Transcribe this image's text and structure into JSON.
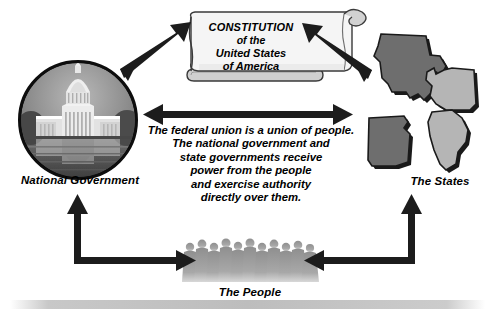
{
  "diagram": {
    "background_color": "#ffffff"
  },
  "scroll": {
    "name": "constitution-scroll",
    "line1": "CONSTITUTION",
    "line2": "of the",
    "line3": "United States",
    "line4": "of America",
    "paper_color": "#f4f4f4",
    "roll_color": "#c9c9c9",
    "outline_color": "#3a3a3a"
  },
  "national_government": {
    "label": "National Government",
    "image_alt": "united-states-capitol-photo",
    "circle_border_color": "#111111",
    "sky_color": "#8d8d8d",
    "building_color": "#e8e8e8"
  },
  "states": {
    "label": "The States",
    "shapes": [
      {
        "name": "texas",
        "fill": "#6e6e6e"
      },
      {
        "name": "washington",
        "fill": "#b5b5b5"
      },
      {
        "name": "arkansas",
        "fill": "#6e6e6e"
      },
      {
        "name": "maine",
        "fill": "#b5b5b5"
      }
    ],
    "shadow_color": "#1a1a1a"
  },
  "people": {
    "label": "The People",
    "silhouette_color": "#9a9a9a",
    "count": 11
  },
  "center_statement": {
    "line1": "The federal union is a union of people.",
    "line2": "The national government and",
    "line3": "state governments receive",
    "line4": "power from the people",
    "line5": "and exercise authority",
    "line6": "directly over them."
  },
  "arrows": {
    "color": "#1c1c1c",
    "items": [
      {
        "name": "arrow-national-to-constitution",
        "style": "double-headed-diagonal"
      },
      {
        "name": "arrow-states-to-constitution",
        "style": "double-headed-diagonal"
      },
      {
        "name": "arrow-national-to-states",
        "style": "double-headed-horizontal"
      },
      {
        "name": "arrow-people-to-national",
        "style": "elbow-up-left"
      },
      {
        "name": "arrow-people-to-states",
        "style": "elbow-up-right"
      }
    ]
  },
  "ground_bar": {
    "name": "ground-shadow-bar",
    "color": "#c4c4c4"
  }
}
